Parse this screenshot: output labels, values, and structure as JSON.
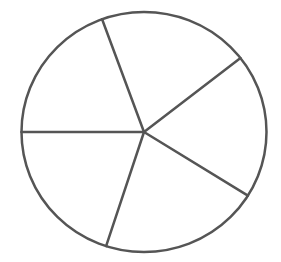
{
  "chart_data": {
    "type": "pie",
    "title": "",
    "categories": [
      "Slice 1",
      "Slice 2",
      "Slice 3",
      "Slice 4",
      "Slice 5"
    ],
    "values": [
      20,
      19.5,
      20,
      21,
      19.5
    ],
    "slice_angles_deg": [
      72,
      70,
      72,
      76,
      70
    ],
    "boundary_angles_deg": [
      38,
      110,
      180,
      252,
      328
    ],
    "labels_visible": false,
    "legend": "none",
    "fill_color": "#ffffff",
    "stroke_color": "#555555"
  },
  "geometry": {
    "cx": 144,
    "cy": 132,
    "rx": 122.5,
    "ry": 120,
    "stroke_width": 2.5
  }
}
